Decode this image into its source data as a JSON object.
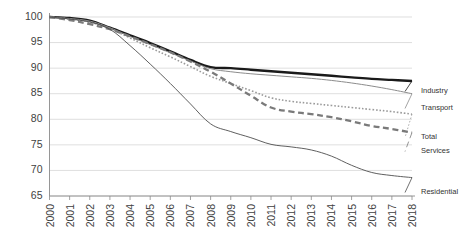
{
  "chart_data": {
    "type": "line",
    "title": "",
    "subtitle": "",
    "xlabel": "",
    "ylabel": "",
    "x": [
      2000,
      2001,
      2002,
      2003,
      2004,
      2005,
      2006,
      2007,
      2008,
      2009,
      2010,
      2011,
      2012,
      2013,
      2014,
      2015,
      2016,
      2017,
      2018
    ],
    "xlim": [
      2000,
      2018
    ],
    "ylim": [
      65,
      100
    ],
    "yticks": [
      65,
      70,
      75,
      80,
      85,
      90,
      95,
      100
    ],
    "ytick_labels": [
      "65",
      "70",
      "75",
      "80",
      "85",
      "90",
      "95",
      "100"
    ],
    "xtick_labels": [
      "2000",
      "2001",
      "2002",
      "2003",
      "2004",
      "2005",
      "2006",
      "2007",
      "2008",
      "2009",
      "2010",
      "2011",
      "2012",
      "2013",
      "2014",
      "2015",
      "2016",
      "2017",
      "2018"
    ],
    "grid": "horizontal",
    "legend_position": "right-inline",
    "series": [
      {
        "name": "Industry",
        "style": "solid-thick",
        "color": "#1a1a1a",
        "width": 2.4,
        "values": [
          100.0,
          99.8,
          99.3,
          97.9,
          96.4,
          94.9,
          93.3,
          91.6,
          90.2,
          90.0,
          89.7,
          89.4,
          89.1,
          88.8,
          88.5,
          88.2,
          87.9,
          87.7,
          87.5
        ]
      },
      {
        "name": "Transport",
        "style": "solid-thin",
        "color": "#8c8c8c",
        "width": 1.0,
        "values": [
          100.0,
          99.7,
          99.2,
          97.9,
          96.2,
          94.6,
          93.0,
          91.4,
          89.9,
          89.3,
          88.9,
          88.6,
          88.3,
          88.0,
          87.6,
          87.1,
          86.5,
          85.8,
          85.0
        ]
      },
      {
        "name": "Total",
        "style": "dotted",
        "color": "#9a9a9a",
        "width": 1.6,
        "values": [
          100.0,
          99.6,
          99.0,
          97.7,
          95.9,
          94.0,
          92.2,
          90.3,
          88.4,
          87.0,
          85.6,
          84.2,
          83.5,
          83.1,
          82.7,
          82.3,
          81.9,
          81.5,
          81.0
        ]
      },
      {
        "name": "Services",
        "style": "dashed",
        "color": "#7a7a7a",
        "width": 2.3,
        "values": [
          100.0,
          99.4,
          98.6,
          97.6,
          96.2,
          94.7,
          93.1,
          91.3,
          89.3,
          87.0,
          84.6,
          82.3,
          81.5,
          81.0,
          80.4,
          79.6,
          78.7,
          78.1,
          77.4
        ]
      },
      {
        "name": "Residential",
        "style": "solid-thin-dark",
        "color": "#4d4d4d",
        "width": 0.9,
        "values": [
          100.0,
          99.6,
          99.0,
          97.6,
          94.4,
          90.8,
          87.0,
          83.0,
          79.1,
          77.6,
          76.4,
          75.1,
          74.6,
          74.0,
          72.8,
          71.0,
          69.6,
          69.0,
          68.6
        ]
      }
    ]
  },
  "legend": {
    "items": [
      {
        "label": "Industry"
      },
      {
        "label": "Transport"
      },
      {
        "label": "Total"
      },
      {
        "label": "Services"
      },
      {
        "label": "Residential"
      }
    ]
  }
}
